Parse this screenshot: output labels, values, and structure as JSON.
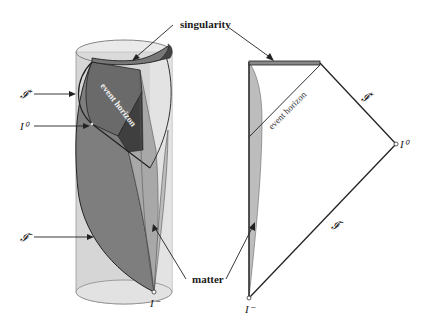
{
  "figure": {
    "colors": {
      "background": "#ffffff",
      "cylinder_fill": "#cfcfcf",
      "cylinder_light": "#e4e4e4",
      "surface_mid": "#8c8c8c",
      "surface_dark": "#5f5f5f",
      "interior_dark": "#4a4a4a",
      "matter_fill": "#bdbdbd",
      "line": "#222222",
      "singularity_fill": "#777777"
    }
  },
  "left_panel": {
    "name": "3D cylinder conformal diagram",
    "labels": {
      "scri_plus": "𝓘⁺",
      "i_zero": "I⁰",
      "scri_minus": "𝓘⁻",
      "event_horizon": "event horizon",
      "i_minus": "I⁻"
    }
  },
  "right_panel": {
    "name": "2D Penrose diagram",
    "labels": {
      "scri_plus": "𝓘⁺",
      "i_zero": "I⁰",
      "scri_minus": "𝓘⁻",
      "event_horizon": "event horizon",
      "i_minus": "I⁻"
    }
  },
  "shared_labels": {
    "singularity": "singularity",
    "matter": "matter"
  }
}
